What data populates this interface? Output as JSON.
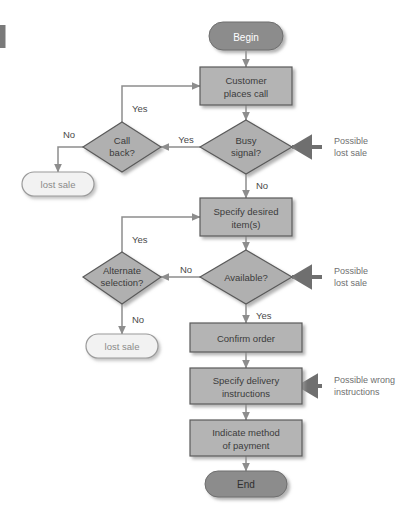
{
  "diagram": {
    "colors": {
      "process_fill": "#b4b4b4",
      "process_stroke": "#5a5a5a",
      "decision_fill": "#b0b0b0",
      "decision_stroke": "#5a5a5a",
      "terminator_dark_fill": "#8c8c8c",
      "terminator_light_fill": "#f2f2f2",
      "terminator_light_stroke": "#9a9a9a",
      "connector": "#8d8d8d",
      "annotation_text": "#6f6f6f",
      "edge_label_text": "#4a4a4a",
      "left_margin_bar": "#7a7a7a",
      "page_background": "#ffffff"
    },
    "nodes": [
      {
        "id": "begin",
        "type": "terminator-dark",
        "label": "Begin"
      },
      {
        "id": "customer",
        "type": "process",
        "label_line1": "Customer",
        "label_line2": "places call"
      },
      {
        "id": "busy",
        "type": "decision",
        "label_line1": "Busy",
        "label_line2": "signal?"
      },
      {
        "id": "callback",
        "type": "decision",
        "label_line1": "Call",
        "label_line2": "back?"
      },
      {
        "id": "lostsale1",
        "type": "terminator-light",
        "label": "lost sale"
      },
      {
        "id": "specifyitems",
        "type": "process",
        "label_line1": "Specify desired",
        "label_line2": "item(s)"
      },
      {
        "id": "available",
        "type": "decision",
        "label_line1": "Available?",
        "label_line2": ""
      },
      {
        "id": "alternate",
        "type": "decision",
        "label_line1": "Alternate",
        "label_line2": "selection?"
      },
      {
        "id": "lostsale2",
        "type": "terminator-light",
        "label": "lost sale"
      },
      {
        "id": "confirm",
        "type": "process",
        "label_line1": "Confirm order",
        "label_line2": ""
      },
      {
        "id": "delivery",
        "type": "process",
        "label_line1": "Specify delivery",
        "label_line2": "instructions"
      },
      {
        "id": "payment",
        "type": "process",
        "label_line1": "Indicate method",
        "label_line2": "of payment"
      },
      {
        "id": "end",
        "type": "terminator-dark",
        "label": "End"
      }
    ],
    "edge_labels": {
      "busy_yes": "Yes",
      "busy_no": "No",
      "callback_yes": "Yes",
      "callback_no": "No",
      "available_no": "No",
      "available_yes": "Yes",
      "alternate_yes": "Yes",
      "alternate_no": "No"
    },
    "annotations": [
      {
        "id": "annot-busy",
        "line1": "Possible",
        "line2": "lost sale"
      },
      {
        "id": "annot-available",
        "line1": "Possible",
        "line2": "lost sale"
      },
      {
        "id": "annot-delivery",
        "line1": "Possible wrong",
        "line2": "instructions"
      }
    ]
  }
}
